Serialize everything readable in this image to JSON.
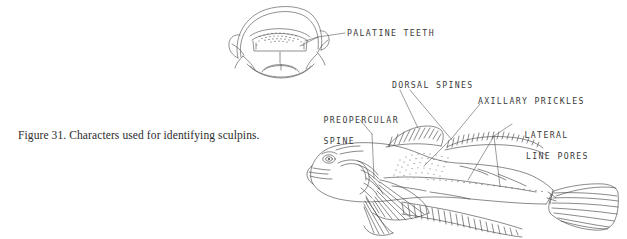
{
  "figure": {
    "caption": "Figure 31.  Characters used for identifying sculpins.",
    "background_color": "#ffffff",
    "ink_color": "#3a3a3a",
    "caption_color": "#2b2b2b"
  },
  "labels": {
    "palatine_teeth": "PALATINE TEETH",
    "dorsal_spines": "DORSAL SPINES",
    "axillary_prickles": "AXILLARY PRICKLES",
    "preopercular_spine_line1": "PREOPERCULAR",
    "preopercular_spine_line2": "SPINE",
    "lateral_line_pores_line1": "LATERAL",
    "lateral_line_pores_line2": "LINE PORES"
  },
  "illustrations": {
    "mouth_view": "frontal-open-mouth-with-palatine-teeth",
    "body_view": "lateral-sculpin-body"
  }
}
